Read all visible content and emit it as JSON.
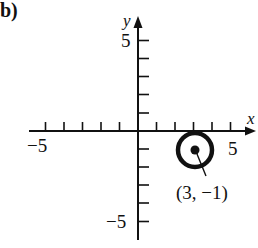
{
  "figure": {
    "part_label": "b)",
    "axes": {
      "x_label": "x",
      "y_label": "y",
      "x_range": [
        -5,
        5
      ],
      "y_range": [
        -5,
        5
      ],
      "tick_step": 1,
      "tick_labels": {
        "x_neg": "−5",
        "x_pos": "5",
        "y_pos": "5",
        "y_neg": "−5"
      }
    },
    "point": {
      "x": 3,
      "y": -1,
      "label": "(3, −1)",
      "marker": "filled-dot-with-circle"
    },
    "colors": {
      "ink": "#111111",
      "background": "#ffffff"
    }
  }
}
